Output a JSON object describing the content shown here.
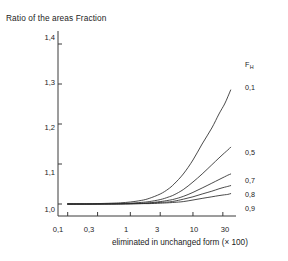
{
  "chart_data": {
    "type": "line",
    "title": "Ratio of the areas Fraction",
    "xlabel": "eliminated in unchanged form (× 100)",
    "ylabel": "",
    "xscale": "log",
    "xlim": [
      0.07,
      42
    ],
    "ylim": [
      0.97,
      1.42
    ],
    "grid": false,
    "legend_position": "right-inline",
    "xticks": [
      "0,1",
      "0,3",
      "1",
      "3",
      "10",
      "30"
    ],
    "xtick_values": [
      0.1,
      0.3,
      1,
      3,
      10,
      30
    ],
    "yticks": [
      "1,0",
      "1,1",
      "1,2",
      "1,3",
      "1,4"
    ],
    "ytick_values": [
      1.0,
      1.1,
      1.2,
      1.3,
      1.4
    ],
    "series_parameter_symbol": "F",
    "series_parameter_subscript": "H",
    "series": [
      {
        "name": "0,1",
        "label": "0,1",
        "x": [
          0.1,
          0.2,
          0.3,
          0.5,
          0.7,
          1,
          1.5,
          2,
          3,
          4,
          5,
          7,
          10,
          14,
          20,
          26,
          32,
          36,
          40
        ],
        "values": [
          1.0,
          1.0,
          1.001,
          1.002,
          1.003,
          1.005,
          1.009,
          1.014,
          1.025,
          1.037,
          1.05,
          1.075,
          1.11,
          1.15,
          1.19,
          1.225,
          1.25,
          1.268,
          1.285
        ]
      },
      {
        "name": "0,5",
        "label": "0,5",
        "x": [
          0.1,
          0.2,
          0.3,
          0.5,
          0.7,
          1,
          1.5,
          2,
          3,
          4,
          5,
          7,
          10,
          14,
          20,
          26,
          32,
          36,
          40
        ],
        "values": [
          1.0,
          1.0,
          1.0,
          1.001,
          1.001,
          1.002,
          1.004,
          1.006,
          1.011,
          1.017,
          1.023,
          1.036,
          1.055,
          1.075,
          1.098,
          1.115,
          1.128,
          1.135,
          1.142
        ]
      },
      {
        "name": "0,7",
        "label": "0,7",
        "x": [
          0.1,
          0.2,
          0.3,
          0.5,
          0.7,
          1,
          1.5,
          2,
          3,
          4,
          5,
          7,
          10,
          14,
          20,
          26,
          32,
          36,
          40
        ],
        "values": [
          1.0,
          1.0,
          1.0,
          1.0,
          1.001,
          1.001,
          1.002,
          1.003,
          1.006,
          1.009,
          1.012,
          1.019,
          1.029,
          1.04,
          1.052,
          1.061,
          1.068,
          1.072,
          1.075
        ]
      },
      {
        "name": "0,8",
        "label": "0,8",
        "x": [
          0.1,
          0.2,
          0.3,
          0.5,
          0.7,
          1,
          1.5,
          2,
          3,
          4,
          5,
          7,
          10,
          14,
          20,
          26,
          32,
          36,
          40
        ],
        "values": [
          1.0,
          1.0,
          1.0,
          1.0,
          1.0,
          1.001,
          1.001,
          1.002,
          1.004,
          1.005,
          1.007,
          1.012,
          1.018,
          1.025,
          1.032,
          1.038,
          1.042,
          1.044,
          1.046
        ]
      },
      {
        "name": "0,9",
        "label": "0,9",
        "x": [
          0.1,
          0.2,
          0.3,
          0.5,
          0.7,
          1,
          1.5,
          2,
          3,
          4,
          5,
          7,
          10,
          14,
          20,
          26,
          32,
          36,
          40
        ],
        "values": [
          1.0,
          1.0,
          1.0,
          1.0,
          1.0,
          1.0,
          1.001,
          1.001,
          1.002,
          1.003,
          1.004,
          1.006,
          1.01,
          1.014,
          1.018,
          1.021,
          1.023,
          1.024,
          1.026
        ]
      }
    ]
  },
  "axis": {
    "line_color": "#3a3a3a",
    "curve_color": "#2b2b2b"
  }
}
